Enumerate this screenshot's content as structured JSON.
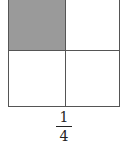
{
  "diagram": {
    "type": "fraction-area-model",
    "rows": 2,
    "cols": 2,
    "shaded_cells": [
      [
        0,
        0
      ]
    ],
    "shade_color": "#9a9a9a",
    "fraction": {
      "numerator": "1",
      "denominator": "4"
    }
  }
}
